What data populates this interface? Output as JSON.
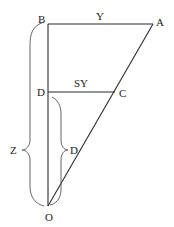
{
  "diagram": {
    "type": "geometry-similar-triangles",
    "points": {
      "B": {
        "label": "B",
        "x": 48,
        "y": 24
      },
      "A": {
        "label": "A",
        "x": 153,
        "y": 24
      },
      "D": {
        "label": "D",
        "x": 48,
        "y": 92
      },
      "C": {
        "label": "C",
        "x": 115,
        "y": 92
      },
      "O": {
        "label": "O",
        "x": 48,
        "y": 206
      }
    },
    "segment_labels": {
      "BA": "Y",
      "DC": "SY",
      "BO": "Z",
      "DO": "D"
    },
    "colors": {
      "line": "#2a2a2a",
      "brace": "#555555",
      "text": "#222222"
    }
  }
}
